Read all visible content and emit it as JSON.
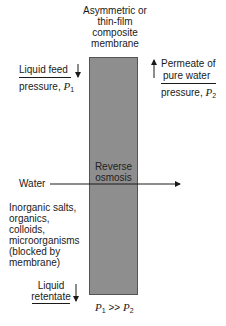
{
  "membrane_label": [
    "Asymmetric or",
    "thin-film",
    "composite",
    "membrane"
  ],
  "feed": {
    "line1": "Liquid feed",
    "line2": "pressure, ",
    "var": "P",
    "sub": "1"
  },
  "permeate": {
    "line1": "Permeate of",
    "line2": "pure water",
    "line3": "pressure, ",
    "var": "P",
    "sub": "2"
  },
  "process": [
    "Reverse",
    "osmosis"
  ],
  "water": "Water",
  "blocked": [
    "Inorganic salts,",
    "organics,",
    "colloids,",
    "microorganisms",
    "(blocked by",
    "membrane)"
  ],
  "retentate": [
    "Liquid",
    "retentate"
  ],
  "condition": {
    "a": "P",
    "a_sub": "1",
    "op": " >> ",
    "b": "P",
    "b_sub": "2"
  },
  "colors": {
    "membrane": "#8e8e8e",
    "text": "#1a1a1a"
  }
}
